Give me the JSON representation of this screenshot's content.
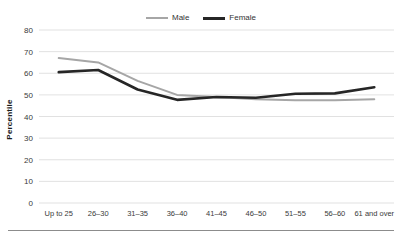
{
  "chart_data": {
    "type": "line",
    "title": "",
    "subtitle": "",
    "xlabel": "",
    "ylabel": "Percentile",
    "categories": [
      "Up to 25",
      "26–30",
      "31–35",
      "36–40",
      "41–45",
      "46–50",
      "51–55",
      "56–60",
      "61 and over"
    ],
    "series": [
      {
        "name": "Male",
        "color": "#a6a6a6",
        "values": [
          67,
          65,
          56.5,
          50,
          49,
          48,
          47.5,
          47.5,
          48
        ]
      },
      {
        "name": "Female",
        "color": "#262626",
        "values": [
          60.5,
          61.5,
          52.5,
          47.7,
          49,
          48.7,
          50.5,
          50.7,
          53.5
        ]
      }
    ],
    "ylim": [
      0,
      80
    ],
    "ytick_values": [
      0,
      10,
      20,
      30,
      40,
      50,
      60,
      70,
      80
    ],
    "ytick_labels": [
      "0",
      "10",
      "20",
      "30",
      "40",
      "50",
      "60",
      "70",
      "80"
    ],
    "grid": "horizontal",
    "legend_position": "top-center"
  },
  "legend": {
    "entries": [
      {
        "label": "Male",
        "icon": "line-swatch-gray"
      },
      {
        "label": "Female",
        "icon": "line-swatch-black"
      }
    ]
  },
  "axes": {
    "y_axis_title": "Percentile"
  }
}
